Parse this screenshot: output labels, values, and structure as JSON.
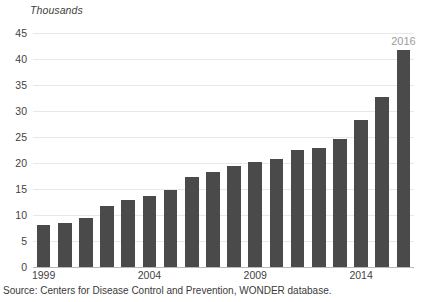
{
  "chart_data": {
    "type": "bar",
    "title": "",
    "unit_label": "Thousands",
    "xlabel": "",
    "ylabel": "",
    "ylim": [
      0,
      45
    ],
    "ytick_step": 5,
    "yticks": [
      0,
      5,
      10,
      15,
      20,
      25,
      30,
      35,
      40,
      45
    ],
    "grid": true,
    "legend": null,
    "bar_color": "#4a4a4a",
    "gridline_color": "#e8e8e8",
    "categories": [
      "1999",
      "2000",
      "2001",
      "2002",
      "2003",
      "2004",
      "2005",
      "2006",
      "2007",
      "2008",
      "2009",
      "2010",
      "2011",
      "2012",
      "2013",
      "2014",
      "2015",
      "2016"
    ],
    "values": [
      8.0,
      8.4,
      9.4,
      11.8,
      12.8,
      13.6,
      14.8,
      17.4,
      18.3,
      19.4,
      20.2,
      20.8,
      22.5,
      22.8,
      24.7,
      28.2,
      32.7,
      41.8
    ],
    "xtick_labels": [
      "1999",
      "2004",
      "2009",
      "2014"
    ],
    "xtick_categories": [
      "1999",
      "2004",
      "2009",
      "2014"
    ],
    "annotations": [
      {
        "text": "2016",
        "category": "2016",
        "color": "#9b9b9b"
      }
    ],
    "source": "Source: Centers for Disease Control and Prevention, WONDER  database."
  }
}
